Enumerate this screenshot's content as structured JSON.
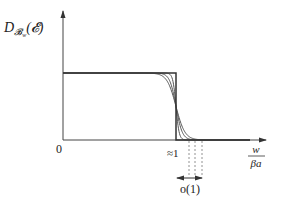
{
  "diagram": {
    "y_axis_label": {
      "main": "D",
      "subscript": "𝓑",
      "subsub": "w",
      "argument": "(𝓔)"
    },
    "origin_label": "0",
    "threshold_label": "≈1",
    "x_axis_label": {
      "numerator": "w",
      "denominator": "βa"
    },
    "width_label": "o(1)",
    "curves": {
      "step": {
        "description": "sharp step function",
        "high": 1,
        "low": 0,
        "threshold": 1
      },
      "smooth": [
        {
          "name": "smooth-curve-1",
          "sharpness": 1.0
        },
        {
          "name": "smooth-curve-2",
          "sharpness": 0.75
        },
        {
          "name": "smooth-curve-3",
          "sharpness": 0.55
        }
      ]
    },
    "colors": {
      "step": "#333333",
      "curves": "#555555",
      "axes": "#444444",
      "dashed": "#777777"
    }
  }
}
